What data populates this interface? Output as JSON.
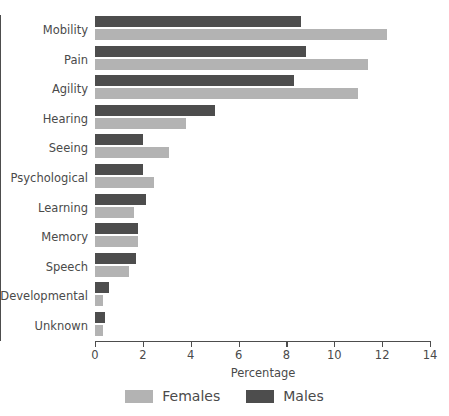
{
  "chart_data": {
    "type": "bar",
    "orientation": "horizontal",
    "title": "",
    "xlabel": "Percentage",
    "ylabel": "",
    "xlim": [
      0,
      14
    ],
    "xticks": [
      0,
      2,
      4,
      6,
      8,
      10,
      12,
      14
    ],
    "xtick_labels": [
      "0",
      "2",
      "4",
      "6",
      "8",
      "10",
      "12",
      "14"
    ],
    "grid": false,
    "legend_position": "bottom-center",
    "categories": [
      "Mobility",
      "Pain",
      "Agility",
      "Hearing",
      "Seeing",
      "Psychological",
      "Learning",
      "Memory",
      "Speech",
      "Developmental",
      "Unknown"
    ],
    "series": [
      {
        "name": "Males",
        "color": "#4d4d4d",
        "values": [
          8.6,
          8.8,
          8.3,
          5.0,
          2.0,
          2.0,
          2.15,
          1.8,
          1.7,
          0.6,
          0.4
        ]
      },
      {
        "name": "Females",
        "color": "#b3b3b3",
        "values": [
          12.2,
          11.4,
          11.0,
          3.8,
          3.1,
          2.45,
          1.65,
          1.8,
          1.4,
          0.35,
          0.35
        ]
      }
    ]
  },
  "legend": {
    "items": [
      {
        "label": "Females",
        "swatch": "female"
      },
      {
        "label": "Males",
        "swatch": "male"
      }
    ]
  },
  "axis": {
    "x_title": "Percentage"
  }
}
